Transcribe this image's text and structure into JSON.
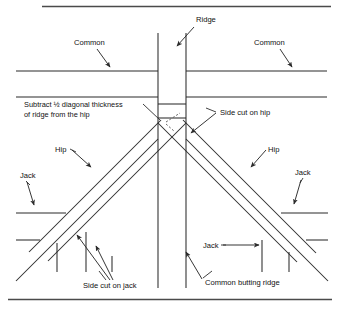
{
  "diagram": {
    "frame": {
      "top_rule": true,
      "bottom_rule": true,
      "rule_color": "#4a4a4a"
    },
    "line_color": "#2b2b2b",
    "labels": [
      {
        "key": "ridge",
        "text": "Ridge",
        "x": 196,
        "y": 22
      },
      {
        "key": "common_left",
        "text": "Common",
        "x": 74,
        "y": 45
      },
      {
        "key": "common_right",
        "text": "Common",
        "x": 254,
        "y": 45
      },
      {
        "key": "subtract_line1",
        "text": "Subtract ½ diagonal thickness",
        "x": 24,
        "y": 107
      },
      {
        "key": "subtract_line2",
        "text": "of ridge from the hip",
        "x": 24,
        "y": 117
      },
      {
        "key": "side_cut_on_hip",
        "text": "Side cut on hip",
        "x": 220,
        "y": 115
      },
      {
        "key": "hip_left",
        "text": "Hip",
        "x": 55,
        "y": 152
      },
      {
        "key": "hip_right",
        "text": "Hip",
        "x": 268,
        "y": 152
      },
      {
        "key": "jack_left",
        "text": "Jack",
        "x": 20,
        "y": 178
      },
      {
        "key": "jack_right",
        "text": "Jack",
        "x": 295,
        "y": 175
      },
      {
        "key": "jack_center_right",
        "text": "Jack",
        "x": 203,
        "y": 248
      },
      {
        "key": "side_cut_on_jack",
        "text": "Side cut on jack",
        "x": 83,
        "y": 288
      },
      {
        "key": "common_butting",
        "text": "Common butting ridge",
        "x": 205,
        "y": 285
      }
    ],
    "geometry": {
      "ridge_band": {
        "x_left": 158,
        "x_right": 186,
        "y_top": 33,
        "y_bottom": 288
      },
      "common_line_upper_y": 71,
      "common_line_lower_y": 97,
      "hip_apex_y": 118,
      "eave_left_upper_y": 213,
      "eave_left_lower_y": 240,
      "eave_right_upper_y": 213,
      "eave_right_lower_y": 240
    },
    "callouts": [
      {
        "key": "ridge-arrow",
        "from": [
          194,
          27
        ],
        "to": [
          176,
          47
        ]
      },
      {
        "key": "common-left-arrow",
        "from": [
          96,
          49
        ],
        "to": [
          110,
          68
        ]
      },
      {
        "key": "common-right-arrow",
        "from": [
          280,
          49
        ],
        "to": [
          292,
          68
        ]
      },
      {
        "key": "subtract-arrow",
        "from": [
          152,
          112
        ],
        "to": [
          166,
          123
        ]
      },
      {
        "key": "side-cut-hip-arrow",
        "from": [
          216,
          114
        ],
        "to": [
          190,
          134
        ]
      },
      {
        "key": "hip-left-arrow",
        "from": [
          72,
          150
        ],
        "to": [
          92,
          168
        ]
      },
      {
        "key": "hip-right-arrow",
        "from": [
          266,
          150
        ],
        "to": [
          250,
          168
        ]
      },
      {
        "key": "jack-left-arrow",
        "from": [
          27,
          182
        ],
        "to": [
          34,
          206
        ]
      },
      {
        "key": "jack-right-arrow",
        "from": [
          300,
          180
        ],
        "to": [
          293,
          205
        ]
      },
      {
        "key": "jack-center-arrow",
        "from": [
          222,
          246
        ],
        "to": [
          258,
          246
        ]
      },
      {
        "key": "side-cut-jack-arrow-1",
        "from": [
          110,
          281
        ],
        "to": [
          76,
          234
        ]
      },
      {
        "key": "side-cut-jack-arrow-2",
        "from": [
          113,
          281
        ],
        "to": [
          95,
          245
        ]
      },
      {
        "key": "common-butting-arrow",
        "from": [
          202,
          280
        ],
        "to": [
          185,
          252
        ]
      }
    ]
  }
}
